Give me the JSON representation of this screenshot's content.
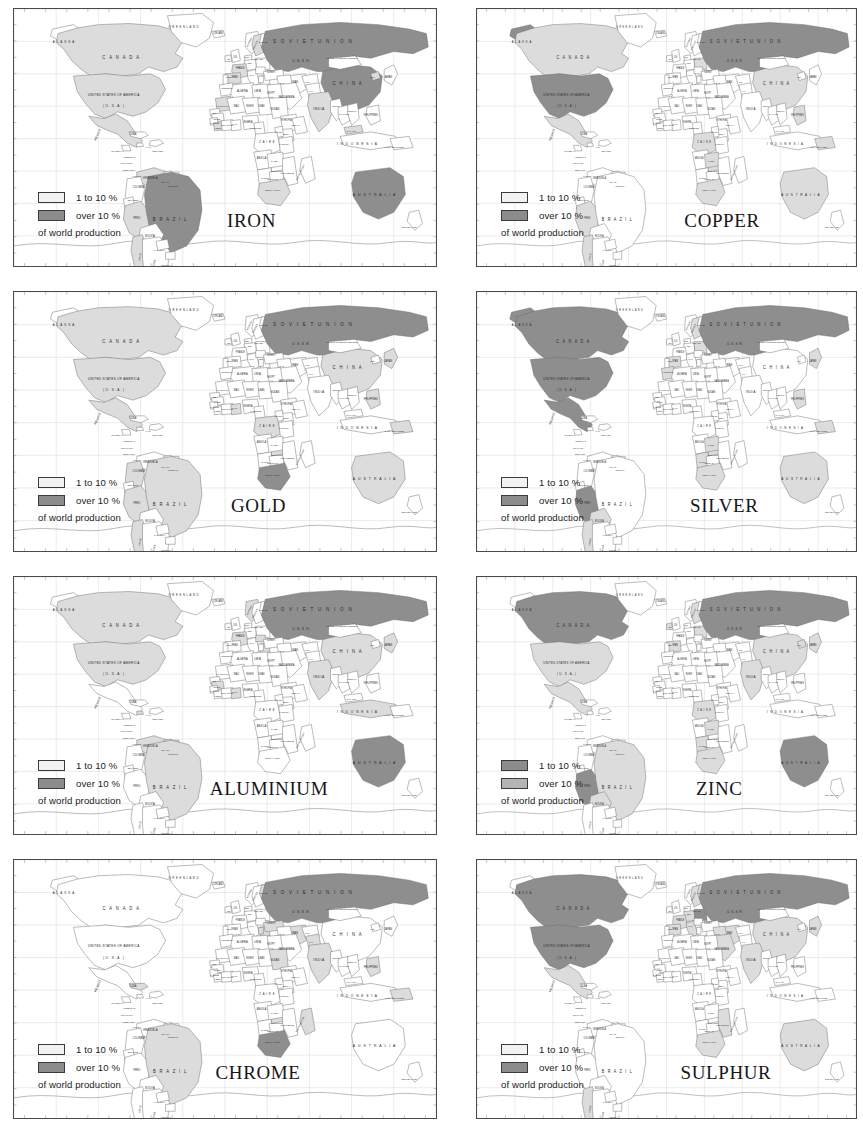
{
  "page": {
    "kind": "map-sheet",
    "columns": 2,
    "rows": 4
  },
  "legend_common": {
    "low_label": "1 to 10 %",
    "high_label": "over 10 %",
    "footer": "of world production",
    "low_color": "#f2f2f2",
    "high_color": "#8c8c8c",
    "border_color": "#3b3b3b"
  },
  "palette": {
    "dark": "#8e8e8e",
    "light": "#dcdcdc",
    "blank": "#ffffff",
    "outline": "#6b6b6b",
    "coast": "#8a8a8a",
    "graticule": "#cfcfcf",
    "frame": "#4a4a4a",
    "label": "#2b2b2b"
  },
  "country_labels": [
    {
      "id": "alaska",
      "text": "A L A S K A",
      "x": 52,
      "y": 30,
      "size": 3.1,
      "track": 0.7
    },
    {
      "id": "canada",
      "text": "C A N A D A",
      "x": 112,
      "y": 45,
      "size": 4.4,
      "track": 1.5
    },
    {
      "id": "usa",
      "text": "UNITED STATES OF AMERICA",
      "x": 104,
      "y": 78,
      "size": 3.3,
      "track": 0.3
    },
    {
      "id": "usa2",
      "text": "( U . S . A . )",
      "x": 104,
      "y": 88,
      "size": 3.3,
      "track": 0.3
    },
    {
      "id": "mexico",
      "text": "MEXICO",
      "x": 88,
      "y": 113,
      "size": 3.0,
      "rot": -62
    },
    {
      "id": "cuba",
      "text": "CUBA",
      "x": 124,
      "y": 113,
      "size": 2.6
    },
    {
      "id": "guatemala",
      "text": "GUATEMALA",
      "x": 108,
      "y": 128,
      "size": 2.2
    },
    {
      "id": "honduras",
      "text": "HONDURAS",
      "x": 120,
      "y": 133,
      "size": 2.2
    },
    {
      "id": "haiti",
      "text": "HAITI",
      "x": 140,
      "y": 124,
      "size": 2.2
    },
    {
      "id": "domrep",
      "text": "DOM. REP.",
      "x": 150,
      "y": 128,
      "size": 2.2
    },
    {
      "id": "nicaragua",
      "text": "NICARAGUA",
      "x": 118,
      "y": 139,
      "size": 2.2
    },
    {
      "id": "costarica",
      "text": "COSTA RICA",
      "x": 120,
      "y": 145,
      "size": 2.2
    },
    {
      "id": "panama",
      "text": "PANAMA",
      "x": 128,
      "y": 150,
      "size": 2.2
    },
    {
      "id": "venezuela",
      "text": "VENEZUELA",
      "x": 142,
      "y": 152,
      "size": 2.6
    },
    {
      "id": "colombia",
      "text": "COLOMBIA",
      "x": 130,
      "y": 160,
      "size": 2.4
    },
    {
      "id": "guyana",
      "text": "GUYANA",
      "x": 158,
      "y": 156,
      "size": 2.2
    },
    {
      "id": "surinam",
      "text": "SURINAM",
      "x": 166,
      "y": 159,
      "size": 2.2
    },
    {
      "id": "ecuador",
      "text": "ECUADOR",
      "x": 124,
      "y": 172,
      "size": 2.2
    },
    {
      "id": "peru",
      "text": "PERU",
      "x": 128,
      "y": 188,
      "size": 2.6
    },
    {
      "id": "brazil",
      "text": "B R A Z I L",
      "x": 163,
      "y": 190,
      "size": 4.4,
      "track": 1.4
    },
    {
      "id": "bolivia",
      "text": "BOLIVIA",
      "x": 142,
      "y": 204,
      "size": 2.6
    },
    {
      "id": "paraguay",
      "text": "PARAGUAY",
      "x": 152,
      "y": 217,
      "size": 2.2
    },
    {
      "id": "chile",
      "text": "CHILE",
      "x": 132,
      "y": 222,
      "size": 2.4,
      "rot": -78
    },
    {
      "id": "uruguay",
      "text": "URUGUAY",
      "x": 159,
      "y": 230,
      "size": 2.2
    },
    {
      "id": "argentina",
      "text": "ARGENTINA",
      "x": 146,
      "y": 232,
      "size": 2.6,
      "rot": -78
    },
    {
      "id": "greenland",
      "text": "G R E E N L A N D",
      "x": 177,
      "y": 17,
      "size": 2.8,
      "track": 0.5
    },
    {
      "id": "iceland",
      "text": "ICELAND",
      "x": 213,
      "y": 22,
      "size": 2.4
    },
    {
      "id": "norway",
      "text": "NORWAY",
      "x": 246,
      "y": 30,
      "size": 2.2,
      "rot": -60
    },
    {
      "id": "sweden",
      "text": "SWEDEN",
      "x": 252,
      "y": 33,
      "size": 2.2,
      "rot": -60
    },
    {
      "id": "finland",
      "text": "FINLAND",
      "x": 260,
      "y": 30,
      "size": 2.2
    },
    {
      "id": "uk",
      "text": "U.K.",
      "x": 231,
      "y": 44,
      "size": 2.3
    },
    {
      "id": "ireland",
      "text": "IRE.",
      "x": 224,
      "y": 46,
      "size": 2.0
    },
    {
      "id": "denmark",
      "text": "DEN.",
      "x": 243,
      "y": 44,
      "size": 2.0
    },
    {
      "id": "poland",
      "text": "POLAND",
      "x": 255,
      "y": 46,
      "size": 2.2
    },
    {
      "id": "germany",
      "text": "GER.",
      "x": 246,
      "y": 49,
      "size": 2.0
    },
    {
      "id": "france",
      "text": "FRANCE",
      "x": 236,
      "y": 54,
      "size": 2.3
    },
    {
      "id": "spain",
      "text": "SPAIN",
      "x": 230,
      "y": 62,
      "size": 2.3
    },
    {
      "id": "portugal",
      "text": "PORT.",
      "x": 224,
      "y": 62,
      "size": 2.0
    },
    {
      "id": "italy",
      "text": "ITALY",
      "x": 248,
      "y": 60,
      "size": 2.2
    },
    {
      "id": "soviet",
      "text": "S O V I E T     U N I O N",
      "x": 312,
      "y": 30,
      "size": 4.8,
      "track": 1.8
    },
    {
      "id": "ussr",
      "text": "U.S.S.R.",
      "x": 300,
      "y": 47,
      "size": 3.4,
      "track": 0.8
    },
    {
      "id": "mongolia",
      "text": "MONGOLIAN PEOPLE'S REPUBLIC",
      "x": 342,
      "y": 45,
      "size": 2.0
    },
    {
      "id": "china",
      "text": "C H I N A",
      "x": 348,
      "y": 68,
      "size": 4.4,
      "track": 1.5
    },
    {
      "id": "japan",
      "text": "JAPAN",
      "x": 390,
      "y": 62,
      "size": 2.6
    },
    {
      "id": "korea",
      "text": "KOR.",
      "x": 374,
      "y": 62,
      "size": 2.0
    },
    {
      "id": "turkey",
      "text": "TURKEY",
      "x": 268,
      "y": 57,
      "size": 2.4
    },
    {
      "id": "iran",
      "text": "IRAN",
      "x": 293,
      "y": 66,
      "size": 2.6
    },
    {
      "id": "iraq",
      "text": "IRAQ",
      "x": 279,
      "y": 67,
      "size": 2.2
    },
    {
      "id": "saudi",
      "text": "SAUDI ARABIA",
      "x": 284,
      "y": 80,
      "size": 2.4
    },
    {
      "id": "afghan",
      "text": "AFGH.",
      "x": 306,
      "y": 66,
      "size": 2.0
    },
    {
      "id": "pakistan",
      "text": "PAK.",
      "x": 310,
      "y": 74,
      "size": 2.1
    },
    {
      "id": "india",
      "text": "INDIA",
      "x": 318,
      "y": 90,
      "size": 3.4,
      "track": 0.6
    },
    {
      "id": "burma",
      "text": "BURMA",
      "x": 336,
      "y": 88,
      "size": 2.2
    },
    {
      "id": "thailand",
      "text": "THAILAND",
      "x": 344,
      "y": 95,
      "size": 2.2
    },
    {
      "id": "vietnam",
      "text": "VIETNAM",
      "x": 352,
      "y": 92,
      "size": 2.2
    },
    {
      "id": "philippines",
      "text": "PHILIPPINES",
      "x": 372,
      "y": 96,
      "size": 2.4
    },
    {
      "id": "malaysia",
      "text": "MALAYSIA",
      "x": 352,
      "y": 110,
      "size": 2.2
    },
    {
      "id": "indonesia",
      "text": "I N D O N E S I A",
      "x": 358,
      "y": 122,
      "size": 3.4,
      "track": 1.0
    },
    {
      "id": "png",
      "text": "PAPUA NEW GUINEA",
      "x": 397,
      "y": 124,
      "size": 2.1
    },
    {
      "id": "morocco",
      "text": "MOROCCO",
      "x": 222,
      "y": 72,
      "size": 2.2
    },
    {
      "id": "algeria",
      "text": "ALGERIA",
      "x": 238,
      "y": 74,
      "size": 2.6
    },
    {
      "id": "libya",
      "text": "LIBYA",
      "x": 254,
      "y": 74,
      "size": 2.6
    },
    {
      "id": "egypt",
      "text": "EGYPT",
      "x": 268,
      "y": 76,
      "size": 2.4
    },
    {
      "id": "mauritania",
      "text": "MAURITANIA",
      "x": 218,
      "y": 88,
      "size": 2.2
    },
    {
      "id": "mali",
      "text": "MALI",
      "x": 232,
      "y": 88,
      "size": 2.4
    },
    {
      "id": "niger",
      "text": "NIGER",
      "x": 246,
      "y": 88,
      "size": 2.4
    },
    {
      "id": "chad",
      "text": "CHAD",
      "x": 258,
      "y": 88,
      "size": 2.4
    },
    {
      "id": "sudan",
      "text": "SUDAN",
      "x": 272,
      "y": 90,
      "size": 2.6
    },
    {
      "id": "senegal",
      "text": "SEN.",
      "x": 209,
      "y": 94,
      "size": 2.0
    },
    {
      "id": "guinea",
      "text": "GUINEA",
      "x": 212,
      "y": 99,
      "size": 2.1
    },
    {
      "id": "sierra",
      "text": "S. LEONE",
      "x": 209,
      "y": 103,
      "size": 2.0
    },
    {
      "id": "liberia",
      "text": "LIBERIA",
      "x": 213,
      "y": 107,
      "size": 2.0
    },
    {
      "id": "ivory",
      "text": "IVORY COAST",
      "x": 222,
      "y": 105,
      "size": 2.0
    },
    {
      "id": "ghana",
      "text": "GHANA",
      "x": 230,
      "y": 104,
      "size": 2.0
    },
    {
      "id": "nigeria",
      "text": "NIGERIA",
      "x": 244,
      "y": 102,
      "size": 2.3
    },
    {
      "id": "cameroon",
      "text": "CAMEROON",
      "x": 252,
      "y": 107,
      "size": 2.0
    },
    {
      "id": "ethiopia",
      "text": "ETHIOPIA",
      "x": 284,
      "y": 100,
      "size": 2.4
    },
    {
      "id": "somalia",
      "text": "SOMALIA",
      "x": 294,
      "y": 105,
      "size": 2.2
    },
    {
      "id": "kenya",
      "text": "KENYA",
      "x": 284,
      "y": 113,
      "size": 2.2
    },
    {
      "id": "uganda",
      "text": "UGANDA",
      "x": 276,
      "y": 111,
      "size": 2.0
    },
    {
      "id": "zaire",
      "text": "Z A I R E",
      "x": 264,
      "y": 120,
      "size": 2.8,
      "track": 0.6
    },
    {
      "id": "tanzania",
      "text": "TANZANIA",
      "x": 282,
      "y": 122,
      "size": 2.2
    },
    {
      "id": "angola",
      "text": "ANGOLA",
      "x": 258,
      "y": 134,
      "size": 2.4
    },
    {
      "id": "zambia",
      "text": "ZAMBIA",
      "x": 272,
      "y": 137,
      "size": 2.2
    },
    {
      "id": "zimbabwe",
      "text": "ZIMBABWE",
      "x": 274,
      "y": 146,
      "size": 2.1
    },
    {
      "id": "mozambique",
      "text": "MOZAMBIQUE",
      "x": 285,
      "y": 148,
      "size": 2.1
    },
    {
      "id": "madagascar",
      "text": "MADAGASCAR",
      "x": 299,
      "y": 147,
      "size": 2.2,
      "rot": -60
    },
    {
      "id": "namibia",
      "text": "NAMIBIA",
      "x": 262,
      "y": 152,
      "size": 2.1
    },
    {
      "id": "botswana",
      "text": "BOTSWANA",
      "x": 270,
      "y": 153,
      "size": 2.0
    },
    {
      "id": "safrica",
      "text": "SOUTH AFRICA",
      "x": 270,
      "y": 163,
      "size": 2.2
    },
    {
      "id": "australia",
      "text": "A U S T R A L I A",
      "x": 376,
      "y": 167,
      "size": 3.6,
      "track": 1.1
    },
    {
      "id": "nz",
      "text": "NEW ZEALAND",
      "x": 412,
      "y": 196,
      "size": 2.2
    }
  ],
  "maps": [
    {
      "id": "iron",
      "title": "IRON",
      "title_x": 222,
      "dark": [
        "soviet",
        "china",
        "brazil",
        "australia"
      ],
      "light": [
        "canada",
        "usa",
        "india",
        "sweden",
        "mexico",
        "venezuela",
        "chile",
        "peru",
        "south_africa",
        "liberia",
        "mauritania",
        "france",
        "spain",
        "north_korea",
        "malaysia"
      ]
    },
    {
      "id": "copper",
      "title": "COPPER",
      "title_x": 216,
      "dark": [
        "soviet",
        "usa",
        "alaska"
      ],
      "light": [
        "canada",
        "china",
        "chile",
        "peru",
        "zaire",
        "zambia",
        "mexico",
        "australia",
        "philippines",
        "poland",
        "south_africa",
        "zimbabwe",
        "papua"
      ]
    },
    {
      "id": "gold",
      "title": "GOLD",
      "title_x": 226,
      "dark": [
        "soviet",
        "south_africa"
      ],
      "light": [
        "canada",
        "usa",
        "australia",
        "brazil",
        "china",
        "philippines",
        "ghana",
        "zimbabwe",
        "papua",
        "chile",
        "peru",
        "colombia",
        "japan",
        "mexico",
        "zaire"
      ]
    },
    {
      "id": "silver",
      "title": "SILVER",
      "title_x": 222,
      "dark": [
        "canada",
        "usa",
        "mexico",
        "peru",
        "soviet",
        "alaska"
      ],
      "light": [
        "australia",
        "chile",
        "bolivia",
        "south_africa",
        "japan",
        "poland",
        "zambia",
        "zimbabwe",
        "namibia",
        "morocco",
        "sweden",
        "spain",
        "philippines",
        "papua"
      ]
    },
    {
      "id": "aluminium",
      "title": "ALUMINIUM",
      "title_x": 204,
      "dark": [
        "soviet",
        "australia"
      ],
      "light": [
        "usa",
        "canada",
        "brazil",
        "china",
        "india",
        "guinea",
        "jamaica",
        "surinam",
        "guyana",
        "venezuela",
        "france",
        "greece",
        "hungary",
        "norway",
        "japan",
        "ghana",
        "indonesia"
      ]
    },
    {
      "id": "zinc",
      "title": "ZINC",
      "title_x": 228,
      "dark": [
        "canada",
        "soviet",
        "australia",
        "peru"
      ],
      "light": [
        "usa",
        "mexico",
        "china",
        "japan",
        "poland",
        "spain",
        "sweden",
        "ireland",
        "zaire",
        "zambia",
        "namibia",
        "south_africa",
        "bolivia",
        "brazil",
        "north_korea",
        "india"
      ]
    },
    {
      "id": "chrome",
      "title": "CHROME",
      "title_x": 210,
      "dark": [
        "soviet",
        "south_africa"
      ],
      "light": [
        "zimbabwe",
        "turkey",
        "india",
        "philippines",
        "brazil",
        "finland",
        "albania",
        "madagascar",
        "iran",
        "cuba",
        "greece",
        "new_caledonia",
        "sudan",
        "pakistan"
      ]
    },
    {
      "id": "sulphur",
      "title": "SULPHUR",
      "title_x": 212,
      "dark": [
        "usa",
        "canada",
        "soviet",
        "poland"
      ],
      "light": [
        "china",
        "japan",
        "mexico",
        "france",
        "spain",
        "italy",
        "iraq",
        "saudi",
        "india",
        "germany",
        "chile",
        "australia",
        "south_africa",
        "finland",
        "sweden",
        "mozambique",
        "iran"
      ]
    }
  ]
}
